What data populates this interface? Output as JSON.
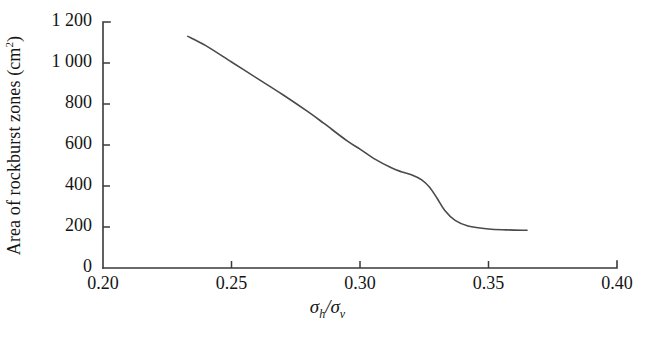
{
  "chart_data": {
    "type": "line",
    "title": "",
    "subtitle": "",
    "xlabel": "σh/σv",
    "xlabel_base": "σ",
    "xlabel_sub1": "h",
    "xlabel_mid": "/σ",
    "xlabel_sub2": "v",
    "ylabel": "Area of rockburst zones (cm2)",
    "ylabel_text": "Area of rockburst zones (cm",
    "ylabel_sup": "2",
    "ylabel_close": ")",
    "xlim": [
      0.2,
      0.4
    ],
    "ylim": [
      0,
      1200
    ],
    "xticks": [
      0.2,
      0.25,
      0.3,
      0.35,
      0.4
    ],
    "xtick_labels": [
      "0.20",
      "0.25",
      "0.30",
      "0.35",
      "0.40"
    ],
    "yticks": [
      0,
      200,
      400,
      600,
      800,
      1000,
      1200
    ],
    "ytick_labels": [
      "0",
      "200",
      "400",
      "600",
      "800",
      "1 000",
      "1 200"
    ],
    "grid": false,
    "legend": null,
    "legend_position": "none",
    "line_color": "#4a4a4a",
    "axis_color": "#3a3a3a",
    "background_color": "#ffffff",
    "series": [
      {
        "name": "Area of rockburst zones",
        "x": [
          0.233,
          0.24,
          0.25,
          0.26,
          0.27,
          0.28,
          0.286,
          0.295,
          0.3,
          0.306,
          0.312,
          0.316,
          0.32,
          0.324,
          0.327,
          0.33,
          0.333,
          0.337,
          0.342,
          0.35,
          0.357,
          0.365
        ],
        "y": [
          1130,
          1085,
          1005,
          925,
          845,
          760,
          705,
          620,
          580,
          530,
          490,
          470,
          455,
          430,
          395,
          340,
          280,
          232,
          205,
          190,
          186,
          184
        ]
      }
    ]
  },
  "figure": {
    "plot_left_px": 103,
    "plot_right_px": 617,
    "plot_top_px": 22,
    "plot_bottom_px": 268
  }
}
